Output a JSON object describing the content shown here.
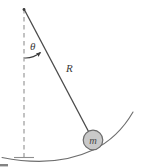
{
  "figure": {
    "type": "physics-diagram",
    "background_color": "#ffffff",
    "width": 141,
    "height": 168
  },
  "labels": {
    "angle": "θ",
    "radius": "R",
    "mass": "m"
  },
  "colors": {
    "rod_line": "#4a4a4a",
    "dashed_line": "#9a9a9a",
    "arc_path": "#6e6e6e",
    "angle_arc": "#3c3c3c",
    "bob_fill": "#c9c9c9",
    "bob_stroke": "#6b6b6b",
    "text": "#3a3a3a",
    "artifact": "#5a5a5a"
  },
  "geometry": {
    "pivot": {
      "x": 24,
      "y": 9
    },
    "bob_center": {
      "x": 93,
      "y": 140
    },
    "bob_radius": 10,
    "vertical_reference": {
      "x": 24,
      "y_top": 9,
      "y_bottom": 160
    },
    "baseline_tick": {
      "x1": 14,
      "x2": 34,
      "y": 157
    },
    "angle_label_pos": {
      "x": 30,
      "y": 50
    },
    "radius_label_pos": {
      "x": 66,
      "y": 72
    },
    "swing_arc": {
      "start_x": 2,
      "start_y": 157,
      "end_x": 133,
      "end_y": 112
    },
    "angle_from_vertical_deg": 28
  }
}
